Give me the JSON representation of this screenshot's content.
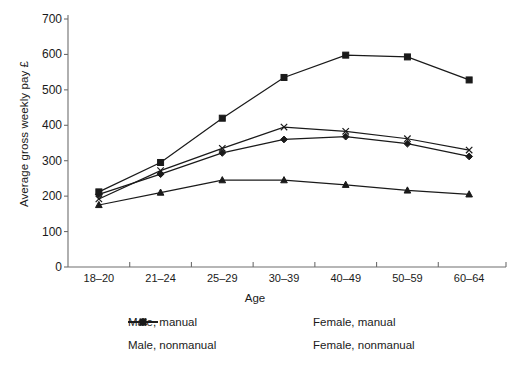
{
  "chart_data": {
    "type": "line",
    "title": "",
    "xlabel": "Age",
    "ylabel": "Average gross weekly pay £",
    "categories": [
      "18–20",
      "21–24",
      "25–29",
      "30–39",
      "40–49",
      "50–59",
      "60–64"
    ],
    "ylim": [
      0,
      700
    ],
    "yticks": [
      0,
      100,
      200,
      300,
      400,
      500,
      600,
      700
    ],
    "ytick_labels": [
      "0",
      "100",
      "200",
      "300",
      "400",
      "500",
      "600",
      "700"
    ],
    "grid": false,
    "legend_position": "bottom",
    "series": [
      {
        "name": "Male, manual",
        "marker": "diamond",
        "color": "#1a1a1a",
        "values": [
          205,
          262,
          322,
          360,
          368,
          348,
          312
        ]
      },
      {
        "name": "Male, nonmanual",
        "marker": "square",
        "color": "#1a1a1a",
        "values": [
          212,
          295,
          420,
          535,
          598,
          593,
          528
        ]
      },
      {
        "name": "Female, manual",
        "marker": "triangle",
        "color": "#1a1a1a",
        "values": [
          175,
          210,
          245,
          245,
          232,
          216,
          205
        ]
      },
      {
        "name": "Female, nonmanual",
        "marker": "x",
        "color": "#1a1a1a",
        "values": [
          192,
          272,
          335,
          395,
          383,
          362,
          330
        ]
      }
    ]
  },
  "legend": {
    "items": [
      {
        "label": "Male, manual",
        "marker": "diamond"
      },
      {
        "label": "Female, manual",
        "marker": "triangle"
      },
      {
        "label": "Male, nonmanual",
        "marker": "square"
      },
      {
        "label": "Female, nonmanual",
        "marker": "x"
      }
    ]
  }
}
